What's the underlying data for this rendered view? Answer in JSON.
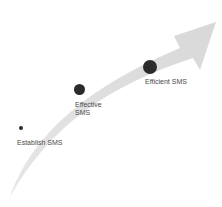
{
  "diagram": {
    "arrow_color": "#dcdcdc",
    "dot_color": "#2b2b2b",
    "stages": [
      {
        "label_line1": "Establish SMS",
        "label_line2": "",
        "size": "small"
      },
      {
        "label_line1": "Effective",
        "label_line2": "SMS",
        "size": "medium"
      },
      {
        "label_line1": "Efficient SMS",
        "label_line2": "",
        "size": "large"
      }
    ]
  }
}
